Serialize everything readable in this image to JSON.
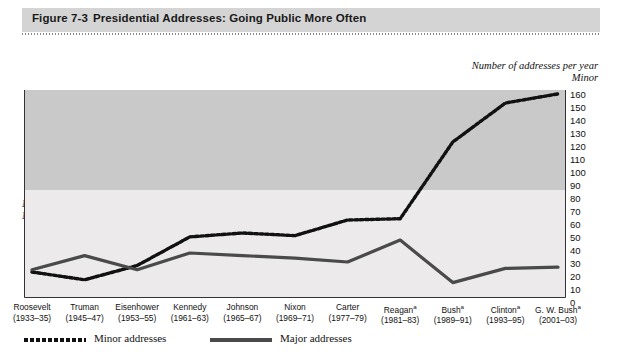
{
  "figure": {
    "number_label": "Figure 7-3",
    "title": "Presidential Addresses: Going Public More Often"
  },
  "captions": {
    "right_line1": "Number of addresses per year",
    "right_line2": "Minor",
    "left_line1": "Number of addresses per year",
    "left_line2": "Major"
  },
  "legend": {
    "minor_label": "Minor addresses",
    "major_label": "Major addresses",
    "minor_style": "dotted",
    "major_style": "solid"
  },
  "colors": {
    "title_band": "#d4d4d4",
    "plot_band_dark": "#c9c9c9",
    "plot_band_light": "#eceaea",
    "minor_line": "#111111",
    "major_line": "#4a4a4a",
    "axis": "#333333",
    "text": "#111111"
  },
  "chart_data": {
    "type": "line",
    "title": "Presidential Addresses: Going Public More Often",
    "xlabel": "",
    "ylabel": "Number of addresses per year",
    "grid": false,
    "legend_position": "bottom-left",
    "categories": [
      "Roosevelt",
      "Truman",
      "Eisenhower",
      "Kennedy",
      "Johnson",
      "Nixon",
      "Carter",
      "Reagan",
      "Bush",
      "Clinton",
      "G. W. Bush"
    ],
    "category_years": [
      "(1933–35)",
      "(1945–47)",
      "(1953–55)",
      "(1961–63)",
      "(1965–67)",
      "(1969–71)",
      "(1977–79)",
      "(1981–83)",
      "(1989–91)",
      "(1993–95)",
      "(2001–03)"
    ],
    "category_footnote_flags": [
      false,
      false,
      false,
      false,
      false,
      false,
      false,
      true,
      true,
      true,
      true
    ],
    "footnote_marker": "a",
    "axes": {
      "left": {
        "name": "Major",
        "caption": "Number of addresses per year",
        "ticks": [
          1,
          2,
          3,
          4,
          5,
          6,
          7,
          8
        ],
        "ylim": [
          1,
          8
        ]
      },
      "right": {
        "name": "Minor",
        "caption": "Number of addresses per year",
        "ticks": [
          0,
          10,
          20,
          30,
          40,
          50,
          60,
          70,
          80,
          90,
          100,
          110,
          120,
          130,
          140,
          150,
          160
        ],
        "ylim": [
          0,
          160
        ]
      }
    },
    "series": [
      {
        "name": "Minor addresses",
        "axis": "right",
        "style": "dotted",
        "values": [
          20,
          14,
          25,
          47,
          50,
          48,
          60,
          61,
          120,
          150,
          157
        ]
      },
      {
        "name": "Major addresses",
        "axis": "left",
        "style": "solid",
        "values": [
          3.2,
          4.3,
          3.2,
          4.5,
          4.3,
          4.1,
          3.8,
          5.5,
          2.2,
          3.3,
          3.4
        ]
      }
    ]
  }
}
